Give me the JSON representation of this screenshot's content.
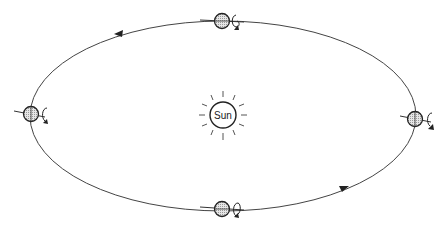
{
  "diagram": {
    "title": "",
    "sun": {
      "label": "Sun",
      "cx": 223,
      "cy": 115,
      "r": 14
    },
    "orbit": {
      "cx": 223,
      "cy": 116,
      "rx": 193,
      "ry": 95,
      "direction": "counter-clockwise"
    },
    "earth_positions": [
      {
        "name": "top",
        "cx": 222,
        "cy": 21
      },
      {
        "name": "left",
        "cx": 30,
        "cy": 114
      },
      {
        "name": "bottom",
        "cx": 222,
        "cy": 209
      },
      {
        "name": "right",
        "cx": 416,
        "cy": 119
      }
    ],
    "arrows": [
      {
        "name": "top-left-arrow",
        "x": 120,
        "y": 33,
        "direction": "left"
      },
      {
        "name": "bottom-right-arrow",
        "x": 343,
        "y": 188,
        "direction": "right"
      }
    ],
    "colors": {
      "stroke": "#333333",
      "earth_fill": "#cfcfcf",
      "background": "#ffffff"
    }
  }
}
